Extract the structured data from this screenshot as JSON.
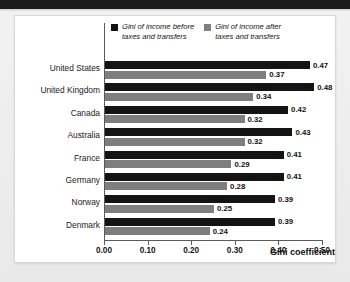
{
  "chart_data": {
    "type": "bar",
    "orientation": "horizontal",
    "title": "",
    "xlabel": "Gini coefficient",
    "ylabel": "",
    "xlim": [
      0.0,
      0.5
    ],
    "xticks": [
      "0.00",
      "0.10",
      "0.20",
      "0.30",
      "0.40",
      "0.50"
    ],
    "xtick_values": [
      0.0,
      0.1,
      0.2,
      0.3,
      0.4,
      0.5
    ],
    "grid": false,
    "legend_position": "top",
    "categories": [
      "United States",
      "United Kingdom",
      "Canada",
      "Australia",
      "France",
      "Germany",
      "Norway",
      "Denmark"
    ],
    "series": [
      {
        "name": "Gini of income before\ntaxes and transfers",
        "color": "#141414",
        "values": [
          0.47,
          0.48,
          0.42,
          0.43,
          0.41,
          0.41,
          0.39,
          0.39
        ],
        "labels": [
          "0.47",
          "0.48",
          "0.42",
          "0.43",
          "0.41",
          "0.41",
          "0.39",
          "0.39"
        ]
      },
      {
        "name": "Gini of income after\ntaxes and transfers",
        "color": "#7e7e7e",
        "values": [
          0.37,
          0.34,
          0.32,
          0.32,
          0.29,
          0.28,
          0.25,
          0.24
        ],
        "labels": [
          "0.37",
          "0.34",
          "0.32",
          "0.32",
          "0.29",
          "0.28",
          "0.25",
          "0.24"
        ]
      }
    ]
  }
}
